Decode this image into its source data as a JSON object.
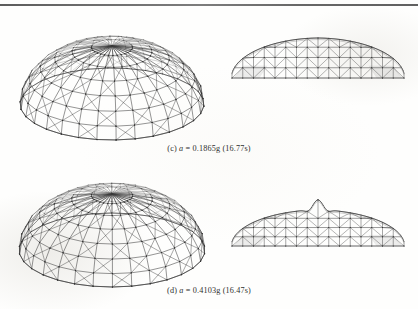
{
  "figure": {
    "type": "lattice-dome-seismic-deformation",
    "background_color": "#fefefd",
    "line_color": "#3a3a3a",
    "top_rule_color": "#5a5a5a",
    "panels": [
      {
        "id": "c",
        "label": "(c)",
        "variable": "a",
        "equals": "=",
        "value": "0.1865g",
        "time": "(16.77s)",
        "caption_full": "(c) a = 0.1865g (16.77s)",
        "views": [
          {
            "name": "isometric-perspective-view",
            "shape": "shallow-ribbed-dome"
          },
          {
            "name": "side-elevation-view",
            "shape": "smooth-dome-profile"
          }
        ]
      },
      {
        "id": "d",
        "label": "(d)",
        "variable": "a",
        "equals": "=",
        "value": "0.4103g",
        "time": "(16.47s)",
        "caption_full": "(d) a = 0.4103g (16.47s)",
        "views": [
          {
            "name": "isometric-perspective-view",
            "shape": "shallow-ribbed-dome"
          },
          {
            "name": "side-elevation-view",
            "shape": "buckled-peaked-dome-profile"
          }
        ]
      }
    ]
  },
  "chart_data": {
    "type": "line",
    "series": [
      {
        "name": "(c) a = 0.1865g (16.77s)",
        "peak_rise_ratio": 0.34,
        "apex_deformation": "uniform"
      },
      {
        "name": "(d) a = 0.4103g (16.47s)",
        "peak_rise_ratio": 0.38,
        "apex_deformation": "local-apex-buckling-spike"
      }
    ],
    "xlabel": "span",
    "ylabel": "rise",
    "grid": false,
    "legend": "none"
  }
}
